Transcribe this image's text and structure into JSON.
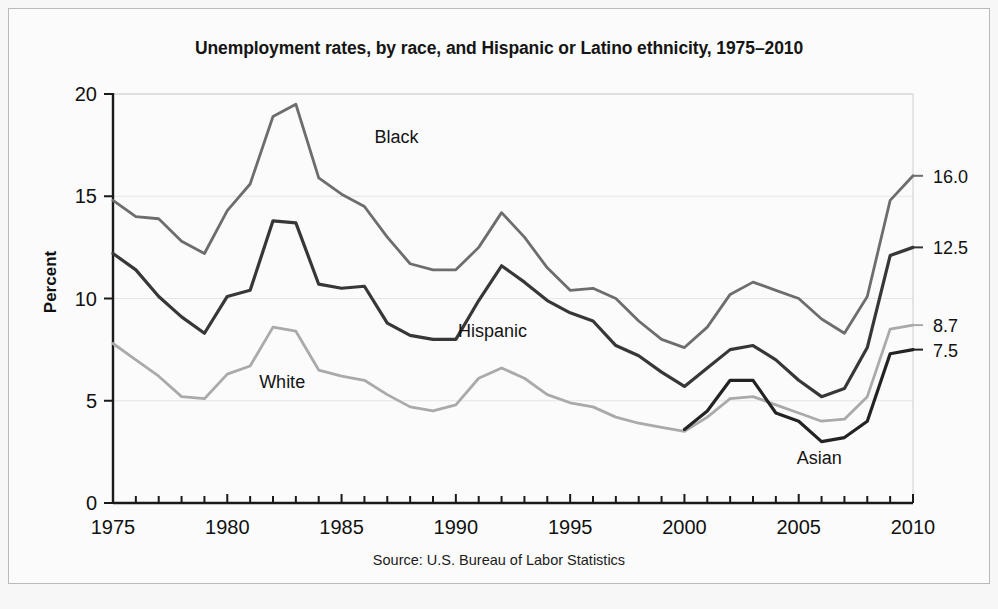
{
  "figure": {
    "title": "Unemployment rates, by race, and Hispanic or Latino ethnicity, 1975–2010",
    "source": "Source: U.S. Bureau of Labor Statistics",
    "background_color": "#f7f7f7",
    "panel_color": "#fbfbfb"
  },
  "chart_data": {
    "type": "line",
    "title": "Unemployment rates, by race, and Hispanic or Latino ethnicity, 1975–2010",
    "subtitle": "",
    "xlabel": "",
    "ylabel": "Percent",
    "xlim": [
      1975,
      2010
    ],
    "ylim": [
      0,
      20
    ],
    "ytick_values": [
      0,
      5,
      10,
      15,
      20
    ],
    "ytick_labels": [
      "0",
      "5",
      "10",
      "15",
      "20"
    ],
    "xtick_values": [
      1975,
      1980,
      1985,
      1990,
      1995,
      2000,
      2005,
      2010
    ],
    "xtick_labels": [
      "1975",
      "1980",
      "1985",
      "1990",
      "1995",
      "2000",
      "2005",
      "2010"
    ],
    "xtick_minor_step": 1,
    "grid": "horizontal",
    "legend_position": "inline-annotations",
    "x": [
      1975,
      1976,
      1977,
      1978,
      1979,
      1980,
      1981,
      1982,
      1983,
      1984,
      1985,
      1986,
      1987,
      1988,
      1989,
      1990,
      1991,
      1992,
      1993,
      1994,
      1995,
      1996,
      1997,
      1998,
      1999,
      2000,
      2001,
      2002,
      2003,
      2004,
      2005,
      2006,
      2007,
      2008,
      2009,
      2010
    ],
    "series": [
      {
        "name": "Black",
        "label": "Black",
        "color": "#6d6d6d",
        "stroke_width": 2.8,
        "end_label": "16.0",
        "label_x": 1987.4,
        "label_y": 17.6,
        "values": [
          14.8,
          14.0,
          13.9,
          12.8,
          12.2,
          14.3,
          15.6,
          18.9,
          19.5,
          15.9,
          15.1,
          14.5,
          13.0,
          11.7,
          11.4,
          11.4,
          12.5,
          14.2,
          13.0,
          11.5,
          10.4,
          10.5,
          10.0,
          8.9,
          8.0,
          7.6,
          8.6,
          10.2,
          10.8,
          10.4,
          10.0,
          9.0,
          8.3,
          10.1,
          14.8,
          16.0
        ]
      },
      {
        "name": "Hispanic",
        "label": "Hispanic",
        "color": "#373737",
        "stroke_width": 3.2,
        "end_label": "12.5",
        "label_x": 1991.6,
        "label_y": 8.1,
        "values": [
          12.2,
          11.4,
          10.1,
          9.1,
          8.3,
          10.1,
          10.4,
          13.8,
          13.7,
          10.7,
          10.5,
          10.6,
          8.8,
          8.2,
          8.0,
          8.0,
          9.9,
          11.6,
          10.8,
          9.9,
          9.3,
          8.9,
          7.7,
          7.2,
          6.4,
          5.7,
          6.6,
          7.5,
          7.7,
          7.0,
          6.0,
          5.2,
          5.6,
          7.6,
          12.1,
          12.5
        ]
      },
      {
        "name": "White",
        "label": "White",
        "color": "#aaaaaa",
        "stroke_width": 2.8,
        "end_label": "8.7",
        "label_x": 1982.4,
        "label_y": 5.6,
        "values": [
          7.8,
          7.0,
          6.2,
          5.2,
          5.1,
          6.3,
          6.7,
          8.6,
          8.4,
          6.5,
          6.2,
          6.0,
          5.3,
          4.7,
          4.5,
          4.8,
          6.1,
          6.6,
          6.1,
          5.3,
          4.9,
          4.7,
          4.2,
          3.9,
          3.7,
          3.5,
          4.2,
          5.1,
          5.2,
          4.8,
          4.4,
          4.0,
          4.1,
          5.2,
          8.5,
          8.7
        ]
      },
      {
        "name": "Asian",
        "label": "Asian",
        "color": "#232323",
        "stroke_width": 3.2,
        "end_label": "7.5",
        "label_x": 2005.9,
        "label_y": 1.9,
        "start_year": 2000,
        "values": [
          null,
          null,
          null,
          null,
          null,
          null,
          null,
          null,
          null,
          null,
          null,
          null,
          null,
          null,
          null,
          null,
          null,
          null,
          null,
          null,
          null,
          null,
          null,
          null,
          null,
          3.6,
          4.5,
          6.0,
          6.0,
          4.4,
          4.0,
          3.0,
          3.2,
          4.0,
          7.3,
          7.5
        ]
      }
    ]
  }
}
